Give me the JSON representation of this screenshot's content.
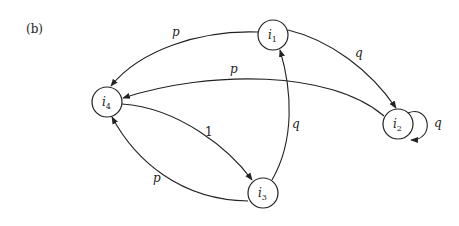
{
  "panel_label": "(b)",
  "nodes": [
    {
      "id": "i1",
      "base": "i",
      "sub": "1",
      "x": 273,
      "y": 35
    },
    {
      "id": "i2",
      "base": "i",
      "sub": "2",
      "x": 398,
      "y": 124
    },
    {
      "id": "i3",
      "base": "i",
      "sub": "3",
      "x": 263,
      "y": 193
    },
    {
      "id": "i4",
      "base": "i",
      "sub": "4",
      "x": 107,
      "y": 102
    }
  ],
  "edges": [
    {
      "from": "i1",
      "to": "i4",
      "label": "p"
    },
    {
      "from": "i1",
      "to": "i2",
      "label": "q"
    },
    {
      "from": "i2",
      "to": "i4",
      "label": "p"
    },
    {
      "from": "i2",
      "to": "i2",
      "label": "q"
    },
    {
      "from": "i4",
      "to": "i3",
      "label": "1"
    },
    {
      "from": "i3",
      "to": "i4",
      "label": "p"
    },
    {
      "from": "i3",
      "to": "i1",
      "label": "q"
    }
  ]
}
